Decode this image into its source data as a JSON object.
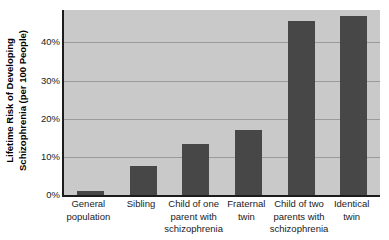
{
  "chart_data": {
    "type": "bar",
    "title": "",
    "xlabel": "",
    "ylabel_line1": "Lifetime Risk of Developing",
    "ylabel_line2": "Schizophrenia (per 100 People)",
    "categories": [
      "General population",
      "Sibling",
      "Child of one parent with schizophrenia",
      "Fraternal twin",
      "Child of two parents with schizophrenia",
      "Identical twin"
    ],
    "category_lines": [
      [
        "General",
        "population"
      ],
      [
        "Sibling"
      ],
      [
        "Child of one",
        "parent with",
        "schizophrenia"
      ],
      [
        "Fraternal",
        "twin"
      ],
      [
        "Child of two",
        "parents with",
        "schizophrenia"
      ],
      [
        "Identical",
        "twin"
      ]
    ],
    "values": [
      1,
      7.5,
      13.5,
      17,
      45.5,
      47
    ],
    "ylim": [
      0,
      48.5
    ],
    "yticks": [
      0,
      10,
      20,
      30,
      40
    ],
    "ytick_labels": [
      "0%",
      "10%",
      "20%",
      "30%",
      "40%"
    ],
    "grid": true,
    "grid_axis": "y",
    "legend": "none",
    "colors": {
      "bar": "#474747",
      "plot_background": "#c9c9c9",
      "gridline": "#9a9a9a",
      "axis": "#1c1c1c",
      "page_background": "#ffffff",
      "text": "#1a1a1a"
    }
  }
}
